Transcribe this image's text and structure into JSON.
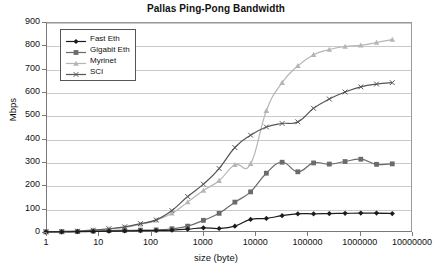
{
  "chart_data": {
    "type": "line",
    "title": "Pallas Ping-Pong Bandwidth",
    "xlabel": "size (byte)",
    "ylabel": "Mbps",
    "xscale": "log",
    "xlim": [
      1,
      10000000
    ],
    "ylim": [
      0,
      900
    ],
    "ytick_labels": [
      "0",
      "100",
      "200",
      "300",
      "400",
      "500",
      "600",
      "700",
      "800",
      "900"
    ],
    "ytick_values": [
      0,
      100,
      200,
      300,
      400,
      500,
      600,
      700,
      800,
      900
    ],
    "xtick_labels": [
      "1",
      "10",
      "100",
      "1000",
      "10000",
      "100000",
      "1000000",
      "10000000"
    ],
    "xtick_values": [
      1,
      10,
      100,
      1000,
      10000,
      100000,
      1000000,
      10000000
    ],
    "grid": "horizontal",
    "legend_position": "top-left",
    "series": [
      {
        "name": "Fast Eth",
        "color": "#1c1c1c",
        "marker": "diamond",
        "x": [
          1,
          2,
          4,
          8,
          16,
          32,
          64,
          128,
          256,
          512,
          1024,
          2048,
          4096,
          8192,
          16384,
          32768,
          65536,
          131072,
          262144,
          524288,
          1048576,
          2097152,
          4194304
        ],
        "y": [
          0.3,
          0.6,
          1.2,
          2.3,
          3.5,
          4.5,
          5.5,
          6.5,
          8,
          12,
          18,
          15,
          25,
          54,
          58,
          70,
          78,
          78,
          79,
          80,
          81,
          81,
          79
        ]
      },
      {
        "name": "Gigabit Eth",
        "color": "#6b6b6b",
        "marker": "square",
        "x": [
          1,
          2,
          4,
          8,
          16,
          32,
          64,
          128,
          256,
          512,
          1024,
          2048,
          4096,
          8192,
          16384,
          32768,
          65536,
          131072,
          262144,
          524288,
          1048576,
          2097152,
          4194304
        ],
        "y": [
          0.5,
          1,
          2,
          4,
          6,
          7,
          8,
          9,
          14,
          25,
          50,
          80,
          128,
          172,
          252,
          299,
          258,
          296,
          291,
          302,
          312,
          290,
          292
        ]
      },
      {
        "name": "Myrinet",
        "color": "#b5b5b5",
        "marker": "triangle",
        "x": [
          1,
          2,
          4,
          8,
          16,
          32,
          64,
          128,
          256,
          512,
          1024,
          2048,
          4096,
          8192,
          16384,
          32768,
          65536,
          131072,
          262144,
          524288,
          1048576,
          2097152,
          4194304
        ],
        "y": [
          1,
          2,
          4,
          8,
          14,
          20,
          33,
          50,
          80,
          128,
          178,
          220,
          288,
          292,
          520,
          640,
          712,
          760,
          782,
          795,
          800,
          812,
          825
        ]
      },
      {
        "name": "SCI",
        "color": "#555555",
        "marker": "cross",
        "x": [
          1,
          2,
          4,
          8,
          16,
          32,
          64,
          128,
          256,
          512,
          1024,
          2048,
          4096,
          8192,
          16384,
          32768,
          65536,
          131072,
          262144,
          524288,
          1048576,
          2097152,
          4194304
        ],
        "y": [
          1,
          2,
          4,
          8,
          14,
          22,
          36,
          52,
          92,
          152,
          205,
          272,
          362,
          415,
          450,
          465,
          472,
          530,
          570,
          600,
          622,
          634,
          640
        ]
      }
    ]
  }
}
